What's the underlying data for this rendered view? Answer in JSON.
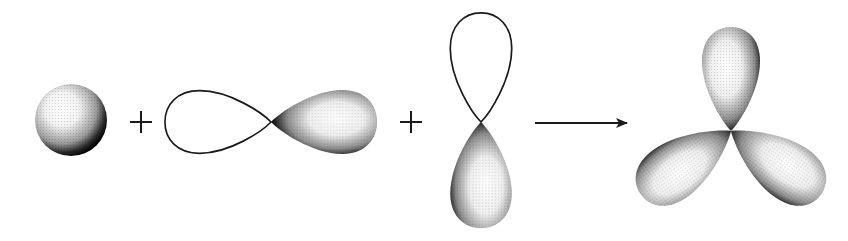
{
  "diagram": {
    "components": [
      {
        "id": "s-orbital",
        "kind": "s",
        "shaded": true
      },
      {
        "id": "plus-1",
        "kind": "operator",
        "symbol": "+"
      },
      {
        "id": "px-orbital",
        "kind": "p",
        "orientation": "horizontal",
        "shaded_lobe": "right"
      },
      {
        "id": "plus-2",
        "kind": "operator",
        "symbol": "+"
      },
      {
        "id": "py-orbital",
        "kind": "p",
        "orientation": "vertical",
        "shaded_lobe": "bottom"
      },
      {
        "id": "reaction-arrow",
        "kind": "arrow",
        "direction": "right"
      },
      {
        "id": "sp2-hybrid",
        "kind": "sp2",
        "lobes": 3,
        "angle_deg": 120
      }
    ],
    "colors": {
      "background": "#ffffff",
      "stroke": "#1a1a1a",
      "shade_dark": "#000000",
      "shade_light": "#ffffff"
    }
  }
}
